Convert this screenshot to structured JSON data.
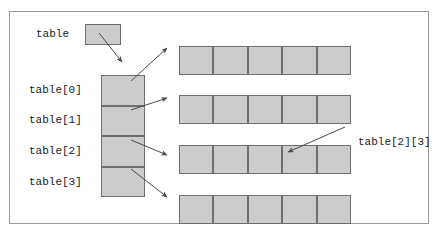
{
  "figure": {
    "title": "",
    "colors": {
      "cell_fill": "#cccccc",
      "cell_border": "#6f6f6f",
      "frame_border": "#9a9a9a",
      "arrow": "#555555",
      "text": "#1a1a1a",
      "background": "#ffffff"
    }
  },
  "pointer_box": {
    "label": "table"
  },
  "column_array": {
    "name": "table",
    "cell_count": 4,
    "labels": [
      "table[0]",
      "table[1]",
      "table[2]",
      "table[3]"
    ]
  },
  "row_arrays": [
    {
      "index": 0,
      "cell_count": 5,
      "cells": [
        "",
        "",
        "",
        "",
        ""
      ]
    },
    {
      "index": 1,
      "cell_count": 5,
      "cells": [
        "",
        "",
        "",
        "",
        ""
      ]
    },
    {
      "index": 2,
      "cell_count": 5,
      "cells": [
        "",
        "",
        "",
        "",
        ""
      ]
    },
    {
      "index": 3,
      "cell_count": 5,
      "cells": [
        "",
        "",
        "",
        "",
        ""
      ]
    }
  ],
  "annotations": [
    {
      "label": "table[2][3]",
      "points_to_row": 2,
      "points_to_cell": 3
    }
  ],
  "arrows": {
    "count": 6,
    "from_pointer_box_to_array": true,
    "from_each_row_pointer": 4,
    "from_annotation": 1
  }
}
